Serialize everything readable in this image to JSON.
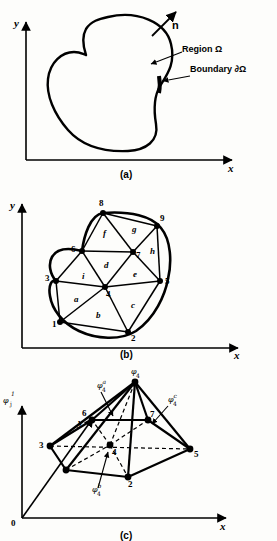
{
  "figure": {
    "title_hidden": "Finite element discretization of a two-dimensional region",
    "background_color": "#fdfdfb",
    "ink_color": "#000000"
  },
  "panels": [
    {
      "id": "a",
      "caption": "(a)",
      "axes": {
        "x_label": "x",
        "y_label": "y"
      },
      "annotations": [
        {
          "name": "normal-vector",
          "text": "n"
        },
        {
          "name": "region-label",
          "text": "Region Ω"
        },
        {
          "name": "boundary-label",
          "text": "Boundary  ∂Ω"
        }
      ]
    },
    {
      "id": "b",
      "caption": "(b)",
      "axes": {
        "x_label": "x",
        "y_label": "y"
      },
      "nodes": [
        {
          "id": "1",
          "label": "1",
          "x": 60,
          "y": 144,
          "lx": 52,
          "ly": 149
        },
        {
          "id": "2",
          "label": "2",
          "x": 128,
          "y": 154,
          "lx": 131,
          "ly": 163
        },
        {
          "id": "3",
          "label": "3",
          "x": 56,
          "y": 103,
          "lx": 45,
          "ly": 103
        },
        {
          "id": "4",
          "label": "4",
          "x": 105,
          "y": 109,
          "lx": 106,
          "ly": 119
        },
        {
          "id": "5",
          "label": "5",
          "x": 160,
          "y": 103,
          "lx": 165,
          "ly": 106
        },
        {
          "id": "6",
          "label": "6",
          "x": 82,
          "y": 73,
          "lx": 71,
          "ly": 74
        },
        {
          "id": "7",
          "label": "7",
          "x": 133,
          "y": 74,
          "lx": 136,
          "ly": 80
        },
        {
          "id": "8",
          "label": "8",
          "x": 103,
          "y": 35,
          "lx": 99,
          "ly": 28
        },
        {
          "id": "9",
          "label": "9",
          "x": 157,
          "y": 48,
          "lx": 160,
          "ly": 43
        }
      ],
      "edges": [
        [
          "1",
          "3"
        ],
        [
          "1",
          "4"
        ],
        [
          "1",
          "2"
        ],
        [
          "3",
          "4"
        ],
        [
          "3",
          "6"
        ],
        [
          "4",
          "6"
        ],
        [
          "4",
          "7"
        ],
        [
          "4",
          "5"
        ],
        [
          "4",
          "2"
        ],
        [
          "2",
          "5"
        ],
        [
          "6",
          "7"
        ],
        [
          "6",
          "8"
        ],
        [
          "7",
          "8"
        ],
        [
          "7",
          "9"
        ],
        [
          "7",
          "5"
        ],
        [
          "8",
          "9"
        ],
        [
          "9",
          "5"
        ]
      ],
      "elements": [
        {
          "label": "a",
          "x": 74,
          "y": 124
        },
        {
          "label": "b",
          "x": 96,
          "y": 140
        },
        {
          "label": "c",
          "x": 131,
          "y": 130
        },
        {
          "label": "d",
          "x": 104,
          "y": 90
        },
        {
          "label": "e",
          "x": 133,
          "y": 99
        },
        {
          "label": "f",
          "x": 103,
          "y": 58
        },
        {
          "label": "g",
          "x": 132,
          "y": 54
        },
        {
          "label": "h",
          "x": 150,
          "y": 76
        },
        {
          "label": "i",
          "x": 82,
          "y": 101
        }
      ]
    },
    {
      "id": "c",
      "caption": "(c)",
      "axes": {
        "x_label": "x",
        "y_label": "y",
        "z_label": "φ",
        "z_sub": "j",
        "z_sup": "1",
        "origin_label": "0"
      },
      "nodes": [
        {
          "id": "1",
          "label": "",
          "x": 66,
          "y": 110
        },
        {
          "id": "2",
          "label": "2",
          "x": 128,
          "y": 117,
          "lx": 128,
          "ly": 127
        },
        {
          "id": "3",
          "label": "3",
          "x": 50,
          "y": 86,
          "lx": 39,
          "ly": 88
        },
        {
          "id": "4",
          "label": "4",
          "x": 110,
          "y": 85,
          "lx": 112,
          "ly": 95
        },
        {
          "id": "5",
          "label": "5",
          "x": 190,
          "y": 89,
          "lx": 194,
          "ly": 97
        },
        {
          "id": "6",
          "label": "6",
          "x": 92,
          "y": 60,
          "lx": 82,
          "ly": 56
        },
        {
          "id": "7",
          "label": "7",
          "x": 148,
          "y": 60,
          "lx": 150,
          "ly": 57
        },
        {
          "id": "apex",
          "label": "",
          "x": 135,
          "y": 22
        }
      ],
      "phi_labels": [
        {
          "name": "phi-4-apex",
          "base": "φ",
          "sub": "4",
          "sup": "",
          "x": 131,
          "y": 14
        },
        {
          "name": "phi-4-a",
          "base": "φ",
          "sub": "4",
          "sup": "a",
          "x": 97,
          "y": 28
        },
        {
          "name": "phi-4-c",
          "base": "φ",
          "sub": "4",
          "sup": "c",
          "x": 168,
          "y": 42
        },
        {
          "name": "phi-4-b",
          "base": "φ",
          "sub": "4",
          "sup": "b",
          "x": 92,
          "y": 132
        }
      ]
    }
  ]
}
